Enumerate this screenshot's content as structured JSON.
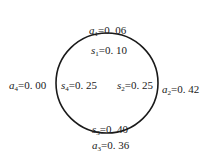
{
  "diagram": {
    "type": "circle-with-labels",
    "circle": {
      "cx": 107,
      "cy": 83,
      "rx": 51,
      "ry": 50,
      "stroke": "#1a1a1a"
    },
    "outer_labels": [
      {
        "var": "a",
        "sub": "1",
        "value": "=0. 06",
        "position": "top"
      },
      {
        "var": "a",
        "sub": "2",
        "value": "=0. 42",
        "position": "right"
      },
      {
        "var": "a",
        "sub": "3",
        "value": "=0. 36",
        "position": "bottom"
      },
      {
        "var": "a",
        "sub": "4",
        "value": "=0. 00",
        "position": "left"
      }
    ],
    "inner_labels": [
      {
        "var": "s",
        "sub": "1",
        "value": "=0. 10",
        "position": "top"
      },
      {
        "var": "s",
        "sub": "2",
        "value": "=0. 25",
        "position": "right"
      },
      {
        "var": "s",
        "sub": "3",
        "value": "=0. 40",
        "position": "bottom"
      },
      {
        "var": "s",
        "sub": "4",
        "value": "=0. 25",
        "position": "left"
      }
    ]
  }
}
